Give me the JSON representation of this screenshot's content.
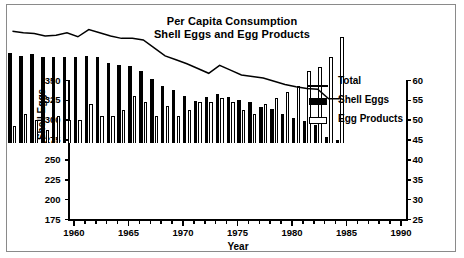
{
  "frame": {
    "border_color": "#8a8a8a"
  },
  "chart_data": {
    "type": "bar",
    "title": "Per Capita Consumption\nShell Eggs and Egg Products",
    "title_line1": "Per Capita Consumption",
    "title_line2": "Shell Eggs and Egg Products",
    "xlabel": "Year",
    "ylabel": "Shell Eggs",
    "y2label": "Egg Products",
    "ylim": [
      175,
      350
    ],
    "y2lim": [
      25,
      60
    ],
    "xlim": [
      1959.5,
      1990.5
    ],
    "grid": false,
    "legend_position": "top-right",
    "ytick_labels": [
      "350",
      "325",
      "300",
      "275",
      "250",
      "225",
      "200",
      "175"
    ],
    "yticks": [
      350,
      325,
      300,
      275,
      250,
      225,
      200,
      175
    ],
    "y2tick_labels": [
      "60",
      "55",
      "50",
      "45",
      "40",
      "35",
      "30",
      "25"
    ],
    "y2ticks": [
      60,
      55,
      50,
      45,
      40,
      35,
      30,
      25
    ],
    "xtick_labels": [
      "1960",
      "1965",
      "1970",
      "1975",
      "1980",
      "1985",
      "1990"
    ],
    "xticks": [
      1960,
      1965,
      1970,
      1975,
      1980,
      1985,
      1990
    ],
    "categories": [
      1960,
      1961,
      1962,
      1963,
      1964,
      1965,
      1966,
      1967,
      1968,
      1969,
      1970,
      1971,
      1972,
      1973,
      1974,
      1975,
      1976,
      1977,
      1978,
      1979,
      1980,
      1981,
      1982,
      1983,
      1984,
      1985,
      1986,
      1987,
      1988,
      1989,
      1990
    ],
    "legend": [
      {
        "name": "Total",
        "marker": "line"
      },
      {
        "name": "Shell Eggs",
        "marker": "solid-bar"
      },
      {
        "name": "Egg Products",
        "marker": "open-bar"
      }
    ],
    "series": [
      {
        "name": "Shell Eggs",
        "axis": "left",
        "marker": "solid-bar",
        "values": [
          289,
          286,
          288,
          285,
          285,
          284,
          284,
          286,
          284,
          277,
          274,
          273,
          267,
          257,
          248,
          243,
          235,
          229,
          234,
          238,
          234,
          230,
          228,
          221,
          219,
          213,
          208,
          204,
          199,
          184,
          180
        ]
      },
      {
        "name": "Egg Products",
        "axis": "right",
        "marker": "open-bar",
        "values": [
          29.5,
          32.5,
          31.0,
          28.5,
          32.0,
          31.0,
          31.0,
          35.0,
          32.0,
          32.0,
          33.5,
          37.0,
          35.5,
          32.0,
          34.5,
          32.0,
          33.5,
          35.5,
          35.5,
          36.5,
          35.5,
          33.5,
          32.5,
          35.0,
          36.5,
          38.0,
          39.5,
          43.5,
          44.5,
          47.0,
          52.0
        ]
      },
      {
        "name": "Total",
        "axis": "left",
        "marker": "line",
        "values": [
          317,
          315,
          314,
          311,
          312,
          315,
          310,
          319,
          315,
          311,
          308,
          308,
          306,
          296,
          286,
          281,
          276,
          270,
          264,
          274,
          268,
          262,
          260,
          258,
          254,
          250,
          247,
          245,
          244,
          232,
          232
        ]
      }
    ]
  }
}
